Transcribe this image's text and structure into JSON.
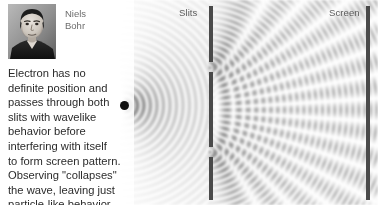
{
  "scene": {
    "width": 378,
    "height": 205,
    "background": "#ffffff",
    "barrier_color": "#4a4a4a",
    "wave_color": "#9a9a9a",
    "source_color": "#111111"
  },
  "labels": {
    "slits": "Slits",
    "screen": "Screen"
  },
  "portrait": {
    "name_line1": "Niels",
    "name_line2": "Bohr",
    "name": "Niels\nBohr",
    "alt": "black-and-white portrait photograph of Niels Bohr"
  },
  "caption": {
    "text": "Electron has no\ndefinite position and\npasses through both\nslits with wavelike\nbehavior before\ninterfering with itself\nto form screen pattern.\nObserving \"collapses\"\nthe wave, leaving just\nparticle-like behavior.",
    "lines": [
      "Electron has no",
      "definite position and",
      "passes through both",
      "slits with wavelike",
      "behavior before",
      "interfering with itself",
      "to form screen pattern.",
      "Observing \"collapses\"",
      "the wave, leaving just",
      "particle-like behavior."
    ]
  },
  "physics": {
    "source": {
      "x": 124,
      "y": 105,
      "radius": 4.5
    },
    "barrier_x": 209,
    "barrier_segments": [
      {
        "y_start": 6,
        "y_end": 62
      },
      {
        "y_start": 72,
        "y_end": 147
      },
      {
        "y_start": 157,
        "y_end": 200
      }
    ],
    "slits": [
      {
        "x": 209,
        "y": 67
      },
      {
        "x": 209,
        "y": 152
      }
    ],
    "screen_x": 366,
    "screen_y_start": 6,
    "screen_y_end": 200,
    "wavelength": 11.5,
    "source_wavelength": 13.0,
    "description": "double-slit interference: circular wavefronts from a point source strike a two-slit barrier; the two slits act as coherent secondary sources whose overlapping circular waves form a hyperbolic interference lattice and banded fringes at the screen"
  }
}
